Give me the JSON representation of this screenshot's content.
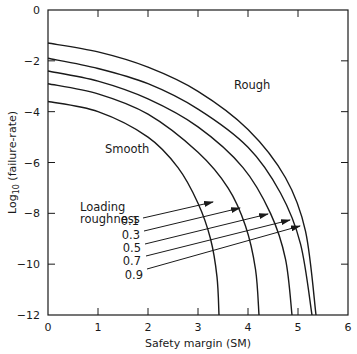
{
  "chart_data": {
    "type": "line",
    "title": "",
    "xlabel": "Safety margin (SM)",
    "ylabel": "Log10 (failure-rate)",
    "ylabel_parts": {
      "prefix": "Log",
      "subscript": "10",
      "suffix": "(failure-rate)"
    },
    "xlim": [
      0,
      6
    ],
    "ylim": [
      -12,
      0
    ],
    "x_ticks": [
      "0",
      "1",
      "2",
      "3",
      "4",
      "5",
      "6"
    ],
    "y_ticks": [
      "0",
      "-2",
      "-4",
      "-6",
      "-8",
      "-10",
      "-12"
    ],
    "grid": false,
    "legend": {
      "title_line1": "Loading",
      "title_line2": "roughness",
      "entries": [
        "0.1",
        "0.3",
        "0.5",
        "0.7",
        "0.9"
      ]
    },
    "annotations": {
      "smooth": "Smooth",
      "rough": "Rough"
    },
    "series": [
      {
        "name": "0.1",
        "points": [
          [
            0,
            -3.6
          ],
          [
            1,
            -4.0
          ],
          [
            2,
            -5.0
          ],
          [
            2.6,
            -6.2
          ],
          [
            3.0,
            -7.6
          ],
          [
            3.25,
            -9.0
          ],
          [
            3.38,
            -10.5
          ],
          [
            3.42,
            -12
          ]
        ]
      },
      {
        "name": "0.3",
        "points": [
          [
            0,
            -2.9
          ],
          [
            1,
            -3.3
          ],
          [
            2,
            -4.1
          ],
          [
            3,
            -5.6
          ],
          [
            3.6,
            -7.0
          ],
          [
            3.95,
            -8.5
          ],
          [
            4.15,
            -10.2
          ],
          [
            4.22,
            -12
          ]
        ]
      },
      {
        "name": "0.5",
        "points": [
          [
            0,
            -2.4
          ],
          [
            1,
            -2.8
          ],
          [
            2,
            -3.5
          ],
          [
            3,
            -4.6
          ],
          [
            3.9,
            -6.2
          ],
          [
            4.45,
            -8.0
          ],
          [
            4.75,
            -9.8
          ],
          [
            4.88,
            -12
          ]
        ]
      },
      {
        "name": "0.7",
        "points": [
          [
            0,
            -1.9
          ],
          [
            1,
            -2.3
          ],
          [
            2,
            -2.9
          ],
          [
            3,
            -3.9
          ],
          [
            4,
            -5.4
          ],
          [
            4.65,
            -7.2
          ],
          [
            5.05,
            -9.2
          ],
          [
            5.28,
            -12
          ]
        ]
      },
      {
        "name": "0.9",
        "points": [
          [
            0,
            -1.3
          ],
          [
            1,
            -1.65
          ],
          [
            2,
            -2.25
          ],
          [
            3,
            -3.2
          ],
          [
            4,
            -4.7
          ],
          [
            4.75,
            -6.6
          ],
          [
            5.15,
            -8.7
          ],
          [
            5.36,
            -12
          ]
        ]
      }
    ]
  }
}
